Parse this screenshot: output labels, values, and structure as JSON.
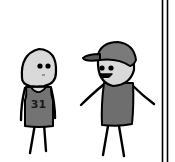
{
  "panel": {
    "width": 175,
    "height": 162,
    "background": "#ffffff"
  },
  "characters": [
    {
      "id": "left-character",
      "description": "sad character in basketball jersey",
      "jersey_number": "31",
      "skin_color": "#d9d9d9",
      "jersey_color": "#737373",
      "expression": "neutral-sad"
    },
    {
      "id": "right-character",
      "description": "smiling character wearing a baseball cap",
      "skin_color": "#d9d9d9",
      "cap_color": "#7a7a7a",
      "shirt_color": "#6e6e6e",
      "expression": "smiling"
    }
  ],
  "panel_border": {
    "position": "right",
    "style": "double-line",
    "color": "#000000"
  }
}
